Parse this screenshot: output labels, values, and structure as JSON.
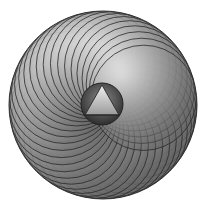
{
  "figure": {
    "center": [
      103,
      105
    ],
    "outer_radius": 94,
    "ring_circles": 36,
    "inner_sphere_radius": 21,
    "colors": {
      "background": "#ffffff",
      "stroke": "#2a2a2a",
      "petal_light": "#e6e6e6",
      "petal_dark": "#5a5a5a",
      "sphere_dark": "#3a3a3a",
      "triangle_light": "#d8d8d8"
    }
  }
}
